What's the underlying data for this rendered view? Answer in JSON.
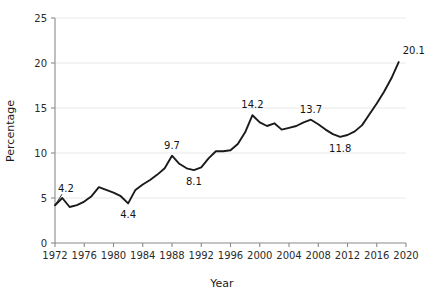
{
  "chart_data": {
    "type": "line",
    "title": "",
    "xlabel": "Year",
    "ylabel": "Percentage",
    "xlim": [
      1972,
      2020
    ],
    "ylim": [
      0,
      25
    ],
    "grid": true,
    "legend": "none",
    "x_ticks": [
      1972,
      1976,
      1980,
      1984,
      1988,
      1992,
      1996,
      2000,
      2004,
      2008,
      2012,
      2016,
      2020
    ],
    "y_ticks": [
      0,
      5,
      10,
      15,
      20,
      25
    ],
    "series": [
      {
        "name": "Percentage",
        "color": "#1a1a1a",
        "x": [
          1972,
          1973,
          1974,
          1975,
          1976,
          1977,
          1978,
          1979,
          1980,
          1981,
          1982,
          1983,
          1984,
          1985,
          1986,
          1987,
          1988,
          1989,
          1990,
          1991,
          1992,
          1993,
          1994,
          1995,
          1996,
          1997,
          1998,
          1999,
          2000,
          2001,
          2002,
          2003,
          2004,
          2005,
          2006,
          2007,
          2008,
          2009,
          2010,
          2011,
          2012,
          2013,
          2014,
          2015,
          2016,
          2017,
          2018,
          2019
        ],
        "values": [
          4.2,
          5.0,
          4.0,
          4.2,
          4.6,
          5.2,
          6.2,
          5.9,
          5.6,
          5.2,
          4.4,
          5.9,
          6.5,
          7.0,
          7.6,
          8.3,
          9.7,
          8.8,
          8.3,
          8.1,
          8.4,
          9.4,
          10.2,
          10.2,
          10.3,
          11.0,
          12.3,
          14.2,
          13.4,
          13.0,
          13.3,
          12.6,
          12.8,
          13.0,
          13.4,
          13.7,
          13.2,
          12.6,
          12.1,
          11.8,
          12.0,
          12.4,
          13.1,
          14.3,
          15.5,
          16.8,
          18.3,
          20.1
        ]
      }
    ],
    "annotations": [
      {
        "label": "4.2",
        "x": 1972,
        "y": 4.2,
        "position": "above-left"
      },
      {
        "label": "4.4",
        "x": 1982,
        "y": 4.4,
        "position": "below"
      },
      {
        "label": "9.7",
        "x": 1988,
        "y": 9.7,
        "position": "above"
      },
      {
        "label": "8.1",
        "x": 1991,
        "y": 8.1,
        "position": "below"
      },
      {
        "label": "14.2",
        "x": 1999,
        "y": 14.2,
        "position": "above"
      },
      {
        "label": "13.7",
        "x": 2007,
        "y": 13.7,
        "position": "above"
      },
      {
        "label": "11.8",
        "x": 2011,
        "y": 11.8,
        "position": "below"
      },
      {
        "label": "20.1",
        "x": 2019,
        "y": 20.1,
        "position": "above-right"
      }
    ]
  }
}
